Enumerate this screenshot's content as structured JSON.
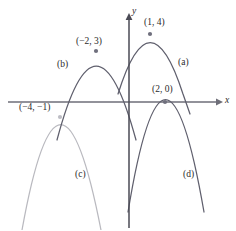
{
  "figure": {
    "background_color": "#ffffff"
  },
  "axes": {
    "x_label": "x",
    "y_label": "y",
    "x_axis_color": "#6e6e78",
    "y_axis_color": "#4a4a55",
    "origin_px": {
      "x": 129,
      "y": 102
    }
  },
  "curve_labels": [
    {
      "id": "a",
      "text": "(a)",
      "x": 178,
      "y": 58
    },
    {
      "id": "b",
      "text": "(b)",
      "x": 57,
      "y": 60
    },
    {
      "id": "c",
      "text": "(c)",
      "x": 75,
      "y": 170
    },
    {
      "id": "d",
      "text": "(d)",
      "x": 183,
      "y": 170
    }
  ],
  "point_labels": [
    {
      "id": "vertex-a",
      "text": "(1, 4)",
      "x": 144,
      "y": 18
    },
    {
      "id": "vertex-b",
      "text": "(−2, 3)",
      "x": 76,
      "y": 37
    },
    {
      "id": "vertex-d",
      "text": "(2, 0)",
      "x": 152,
      "y": 85
    },
    {
      "id": "vertex-c",
      "text": "(−4, −1)",
      "x": 19,
      "y": 103
    }
  ],
  "chart_data": {
    "type": "line",
    "xlabel": "x",
    "ylabel": "y",
    "grid": false,
    "legend": "inline-curve-labels",
    "axis_origin_px": {
      "x": 129,
      "y": 102
    },
    "scale_px_per_unit": {
      "x": 17.5,
      "y": 17.0
    },
    "series": [
      {
        "name": "(a)",
        "label": "(a)",
        "color": "#5f5f6d",
        "vertex": [
          1,
          4
        ],
        "vertex_label": "(1, 4)",
        "vertex_marker": true,
        "opens": "down",
        "path_px": "M 118,94 Q 150,-9 183,94 L 190,114"
      },
      {
        "name": "(b)",
        "label": "(b)",
        "color": "#5f5f6d",
        "vertex": [
          -2,
          3
        ],
        "vertex_label": "(−2, 3)",
        "vertex_marker": true,
        "opens": "down",
        "path_px": "M 57,140 Q 96,-8 136,140"
      },
      {
        "name": "(c)",
        "label": "(c)",
        "color": "#b9b9bf",
        "vertex": [
          -4,
          -1
        ],
        "vertex_label": "(−4, −1)",
        "vertex_marker": true,
        "opens": "down",
        "path_px": "M 22,230 Q 60,19 101,230"
      },
      {
        "name": "(d)",
        "label": "(d)",
        "color": "#5f5f6d",
        "vertex": [
          2,
          0
        ],
        "vertex_label": "(2, 0)",
        "vertex_marker": true,
        "opens": "down",
        "path_px": "M 128,212 Q 165,-13 204,212"
      }
    ],
    "vertex_points": [
      {
        "label": "(1, 4)",
        "data": [
          1,
          4
        ],
        "px": [
          150,
          34
        ]
      },
      {
        "label": "(−2, 3)",
        "data": [
          -2,
          3
        ],
        "px": [
          96,
          51
        ]
      },
      {
        "label": "(2, 0)",
        "data": [
          2,
          0
        ],
        "px": [
          165,
          102
        ]
      },
      {
        "label": "(−4, −1)",
        "data": [
          -4,
          -1
        ],
        "px": [
          60,
          117
        ]
      }
    ]
  }
}
